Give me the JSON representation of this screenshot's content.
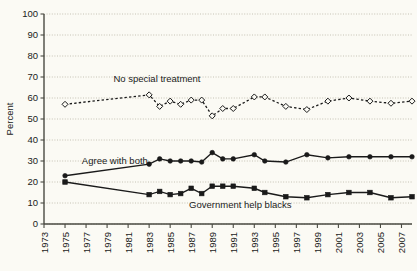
{
  "chart_data": {
    "type": "line",
    "title": "",
    "xlabel": "",
    "ylabel": "Percent",
    "ylim": [
      0,
      100
    ],
    "ytick_step": 10,
    "yticks": [
      0,
      10,
      20,
      30,
      40,
      50,
      60,
      70,
      80,
      90,
      100
    ],
    "xticks": [
      1973,
      1975,
      1977,
      1979,
      1981,
      1983,
      1985,
      1987,
      1989,
      1991,
      1993,
      1995,
      1997,
      1999,
      2001,
      2003,
      2005,
      2007
    ],
    "xlim": [
      1973,
      2008
    ],
    "grid": true,
    "legend_position": "inline-annotations",
    "annotations": [
      {
        "text": "No special treatment",
        "x": 1979.6,
        "y": 67.5
      },
      {
        "text": "Agree with both",
        "x": 1976.6,
        "y": 28.5
      },
      {
        "text": "Government help blacks",
        "x": 1986.8,
        "y": 7.5
      }
    ],
    "series": [
      {
        "name": "No special treatment",
        "marker": "open-diamond",
        "line_style": "dashed",
        "color": "#1a1a1a",
        "x": [
          1975,
          1983,
          1984,
          1985,
          1986,
          1987,
          1988,
          1989,
          1990,
          1991,
          1993,
          1994,
          1996,
          1998,
          2000,
          2002,
          2004,
          2006,
          2008
        ],
        "values": [
          57,
          61.5,
          56,
          58.5,
          57,
          59,
          59,
          51.5,
          55,
          55,
          60.5,
          60.5,
          56,
          54.5,
          58.5,
          60,
          58.5,
          57.5,
          58.5
        ]
      },
      {
        "name": "Agree with both",
        "marker": "filled-circle",
        "line_style": "solid",
        "color": "#1a1a1a",
        "x": [
          1975,
          1983,
          1984,
          1985,
          1986,
          1987,
          1988,
          1989,
          1990,
          1991,
          1993,
          1994,
          1996,
          1998,
          2000,
          2002,
          2004,
          2006,
          2008
        ],
        "values": [
          23,
          28.5,
          31,
          30,
          30,
          30,
          29.5,
          34,
          31,
          31,
          33,
          30,
          29.5,
          33,
          31.5,
          32,
          32,
          32,
          32
        ]
      },
      {
        "name": "Government help blacks",
        "marker": "filled-square",
        "line_style": "solid",
        "color": "#1a1a1a",
        "x": [
          1975,
          1983,
          1984,
          1985,
          1986,
          1987,
          1988,
          1989,
          1990,
          1991,
          1993,
          1994,
          1996,
          1998,
          2000,
          2002,
          2004,
          2006,
          2008
        ],
        "values": [
          20,
          14,
          15.5,
          14,
          14.5,
          17,
          14.5,
          18,
          18,
          18,
          17,
          15,
          13,
          12.5,
          14,
          15,
          15,
          12.5,
          13
        ]
      }
    ]
  }
}
